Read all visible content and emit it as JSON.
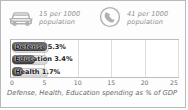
{
  "card": {
    "border_color": "#b9b9b9",
    "background": "#fdfdfd"
  },
  "stats": [
    {
      "icon": "car-icon",
      "value_line1": "15 per 1000",
      "value_line2": "population",
      "number": 15,
      "unit": "per 1000 population",
      "subject": "cars"
    },
    {
      "icon": "telephone-icon",
      "value_line1": "41 per 1000",
      "value_line2": "population",
      "number": 41,
      "unit": "per 1000 population",
      "subject": "telephones"
    }
  ],
  "chart_data": {
    "type": "bar",
    "orientation": "horizontal",
    "title": "",
    "caption": "Defense, Health, Education spending as % of GDP",
    "categories": [
      "Defense",
      "Education",
      "Health"
    ],
    "values": [
      5.3,
      3.4,
      1.7
    ],
    "value_labels": [
      "Defense 5.3%",
      "Education 3.4%",
      "Health 1.7%"
    ],
    "xlabel": "",
    "ylabel": "",
    "xlim": [
      0,
      25
    ],
    "xticks": [
      0,
      5,
      10,
      15,
      20,
      25
    ],
    "xtick_labels": [
      "0",
      "5",
      "10",
      "15",
      "20",
      "25"
    ],
    "grid": true,
    "legend": false,
    "bar_color": "#3a3a3a",
    "plate_color": "#e2e2e2"
  }
}
